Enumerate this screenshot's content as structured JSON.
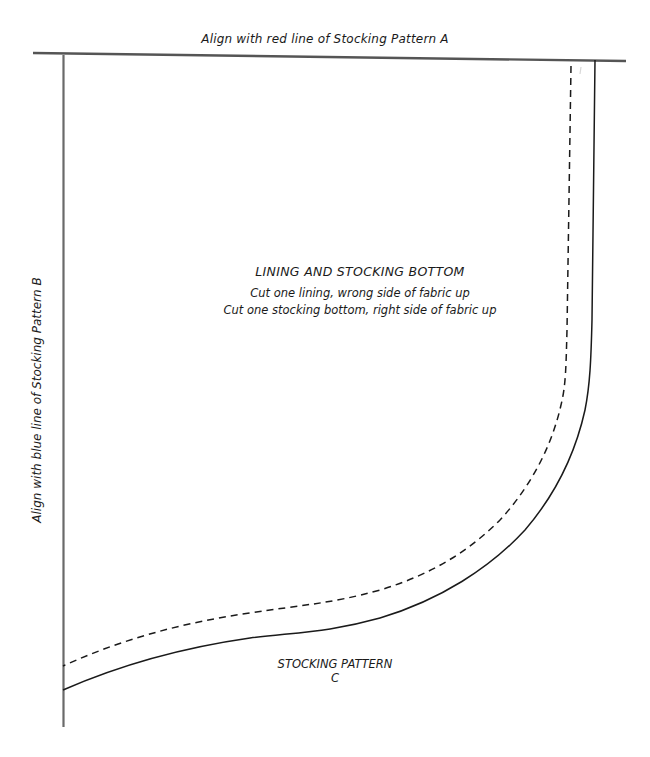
{
  "document": {
    "type": "sewing-pattern-piece",
    "top_alignment_label": "Align with red line of Stocking Pattern A",
    "side_alignment_label": "Align with blue line of Stocking Pattern B",
    "piece_title": "LINING AND STOCKING BOTTOM",
    "instructions": [
      "Cut one lining, wrong side of fabric up",
      "Cut one stocking bottom, right side of fabric up"
    ],
    "pattern_name": "STOCKING PATTERN",
    "pattern_letter": "C"
  },
  "colors": {
    "guide_line": "#555555",
    "cut_line": "#1a1a1a",
    "seam_line": "#1a1a1a",
    "text": "#1a1a1a",
    "background": "#ffffff"
  },
  "line_styles": {
    "cut_line": "solid",
    "seam_line": "dashed",
    "alignment_guides": "solid"
  }
}
